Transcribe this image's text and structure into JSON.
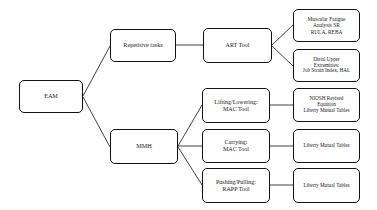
{
  "diagram": {
    "type": "flowchart",
    "orientation": "left-to-right",
    "nodes": {
      "root": {
        "label": "EAM",
        "lines": [
          "EAM"
        ]
      },
      "repetitive_tasks": {
        "label": "Repetitive tasks",
        "lines": [
          "Repetitive tasks"
        ]
      },
      "mmh": {
        "label": "MMH",
        "lines": [
          "MMH"
        ]
      },
      "art_tool": {
        "label": "ART Tool",
        "lines": [
          "ART Tool"
        ]
      },
      "muscular_fatigue": {
        "label": "Muscular Fatigue Analysis SR RULA, REBA",
        "lines": [
          "Muscular Fatigue",
          "Analysis SR",
          "RULA, REBA"
        ]
      },
      "distal_upper": {
        "label": "Distal Upper Extremities: Job Strain Index, HAL",
        "lines": [
          "Distal Upper",
          "Extremities:",
          "Job Strain Index, HAL"
        ]
      },
      "lifting_lowering": {
        "label": "Lifting/Lowering: MAC Tool",
        "lines": [
          "Lifting/Lowering:",
          "MAC Tool"
        ]
      },
      "carrying": {
        "label": "Carrying: MAC Tool",
        "lines": [
          "Carrying:",
          "MAC Tool"
        ]
      },
      "pushing_pulling": {
        "label": "Pushing/Pulling: RAPP Tool",
        "lines": [
          "Pushing/Pulling:",
          "RAPP Tool"
        ]
      },
      "niosh": {
        "label": "NIOSH Revised Equation Liberty Mutual Tables",
        "lines": [
          "NIOSH Revised",
          "Equation",
          "Liberty Mutual Tables"
        ]
      },
      "liberty_carrying": {
        "label": "Liberty Mutual Tables",
        "lines": [
          "Liberty Mutual Tables"
        ]
      },
      "liberty_pushing": {
        "label": "Liberty Mutual Tables",
        "lines": [
          "Liberty Mutual Tables"
        ]
      }
    },
    "edges": [
      {
        "from": "root",
        "to": "repetitive_tasks"
      },
      {
        "from": "root",
        "to": "mmh"
      },
      {
        "from": "repetitive_tasks",
        "to": "art_tool"
      },
      {
        "from": "art_tool",
        "to": "muscular_fatigue"
      },
      {
        "from": "art_tool",
        "to": "distal_upper"
      },
      {
        "from": "mmh",
        "to": "lifting_lowering"
      },
      {
        "from": "mmh",
        "to": "carrying"
      },
      {
        "from": "mmh",
        "to": "pushing_pulling"
      },
      {
        "from": "lifting_lowering",
        "to": "niosh"
      },
      {
        "from": "carrying",
        "to": "liberty_carrying"
      },
      {
        "from": "pushing_pulling",
        "to": "liberty_pushing"
      }
    ],
    "style": {
      "stroke": "#111111",
      "fill": "#ffffff",
      "background": "#ffffff",
      "corner_radius": 5
    }
  }
}
